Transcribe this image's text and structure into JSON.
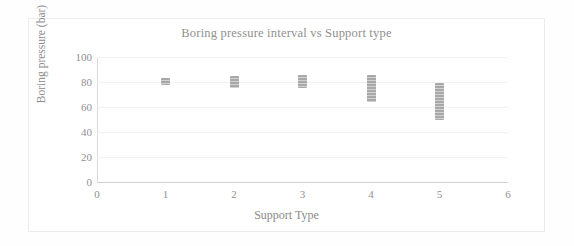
{
  "chart_data": {
    "type": "scatter",
    "title": "Boring pressure interval vs Support type",
    "xlabel": "Support Type",
    "ylabel": "Boring pressure (bar)",
    "xlim": [
      0,
      6
    ],
    "ylim": [
      0,
      100
    ],
    "xticks": [
      "0",
      "1",
      "2",
      "3",
      "4",
      "5",
      "6"
    ],
    "yticks": [
      "0",
      "20",
      "40",
      "60",
      "80",
      "100"
    ],
    "grid": true,
    "legend": "none",
    "marker_color": "#9a9a9a",
    "x": [
      1,
      2,
      3,
      4,
      5
    ],
    "series": [
      {
        "name": "Boring pressure interval",
        "intervals": [
          {
            "support_type": 1,
            "min": 78,
            "max": 83,
            "center": 80.5
          },
          {
            "support_type": 2,
            "min": 75,
            "max": 85,
            "center": 80.0
          },
          {
            "support_type": 3,
            "min": 75,
            "max": 86,
            "center": 80.5
          },
          {
            "support_type": 4,
            "min": 64,
            "max": 86,
            "center": 75.0
          },
          {
            "support_type": 5,
            "min": 50,
            "max": 79,
            "center": 64.5
          }
        ]
      }
    ]
  },
  "figure": {
    "title": "Boring pressure interval vs Support type",
    "x_axis_title": "Support Type",
    "y_axis_title": "Boring pressure (bar)"
  }
}
